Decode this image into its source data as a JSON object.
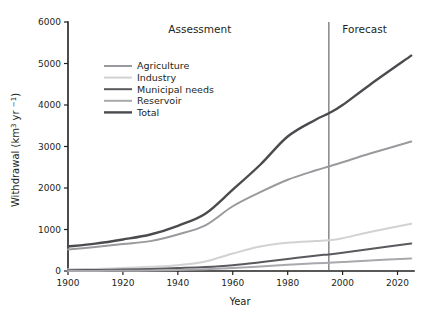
{
  "chart_data": {
    "type": "line",
    "title": "",
    "xlabel": "Year",
    "ylabel": "Withdrawal (km³ yr⁻¹)",
    "xlim": [
      1900,
      2026
    ],
    "ylim": [
      0,
      6000
    ],
    "xticks": [
      1900,
      1920,
      1940,
      1960,
      1980,
      2000,
      2020
    ],
    "xticklabels": [
      "1900",
      "1920",
      "1940",
      "1960",
      "1980",
      "2000",
      "2020"
    ],
    "yticks": [
      0,
      1000,
      2000,
      3000,
      4000,
      5000,
      6000
    ],
    "yticklabels": [
      "0",
      "1000",
      "2000",
      "3000",
      "4000",
      "5000",
      "6000"
    ],
    "grid": false,
    "legend_position": "upper-left-inside",
    "x": [
      1900,
      1910,
      1920,
      1930,
      1940,
      1950,
      1960,
      1970,
      1980,
      1990,
      1995,
      2000,
      2010,
      2025
    ],
    "series": [
      {
        "name": "Agriculture",
        "color": "#9a9a9e",
        "width": 2.0,
        "values": [
          520,
          580,
          650,
          720,
          880,
          1100,
          1560,
          1900,
          2200,
          2420,
          2520,
          2620,
          2830,
          3120
        ]
      },
      {
        "name": "Industry",
        "color": "#d2d2d4",
        "width": 2.0,
        "values": [
          40,
          50,
          70,
          100,
          140,
          230,
          420,
          590,
          680,
          720,
          740,
          790,
          940,
          1140
        ]
      },
      {
        "name": "Municipal needs",
        "color": "#5a5a5e",
        "width": 2.0,
        "values": [
          20,
          25,
          35,
          50,
          70,
          95,
          140,
          210,
          290,
          370,
          400,
          440,
          530,
          660
        ]
      },
      {
        "name": "Reservoir",
        "color": "#a9a9ad",
        "width": 2.0,
        "values": [
          0,
          2,
          5,
          12,
          25,
          45,
          75,
          110,
          150,
          185,
          200,
          215,
          255,
          300
        ]
      },
      {
        "name": "Total",
        "color": "#4b4b4f",
        "width": 2.4,
        "values": [
          590,
          660,
          760,
          880,
          1090,
          1380,
          1960,
          2560,
          3240,
          3640,
          3800,
          4000,
          4490,
          5190
        ]
      }
    ],
    "annotations": [
      {
        "name": "assessment-label",
        "text": "Assessment",
        "x": 1948
      },
      {
        "name": "forecast-label",
        "text": "Forecast",
        "x": 2008
      }
    ],
    "divider": {
      "name": "assessment-forecast-divider",
      "x": 1995
    }
  },
  "legend": {
    "entries": [
      {
        "label": "Agriculture"
      },
      {
        "label": "Industry"
      },
      {
        "label": "Municipal needs"
      },
      {
        "label": "Reservoir"
      },
      {
        "label": "Total"
      }
    ]
  }
}
